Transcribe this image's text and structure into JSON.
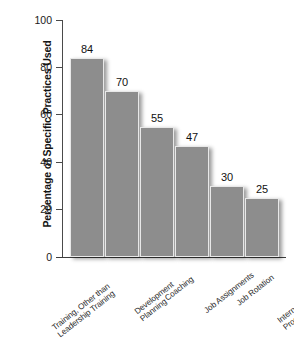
{
  "chart_data": {
    "type": "bar",
    "title": "",
    "subtitle": "",
    "xlabel": "",
    "ylabel": "Percentage of Specific Practices Used",
    "ylim": [
      0,
      100
    ],
    "yticks": [
      0,
      20,
      40,
      60,
      80,
      100
    ],
    "ytick_labels": [
      "0",
      "20",
      "40",
      "60",
      "80",
      "100"
    ],
    "grid": false,
    "legend": null,
    "bar_color": "#8d8d8d",
    "axis_color": "#4a4a4a",
    "background_color": "#ffffff",
    "categories": [
      "Training, Other than\nLeadership Training",
      "Development\nPlanning",
      "Coaching",
      "Job Assignments",
      "Job Rotation",
      "Internal Mentoring\nPrograms"
    ],
    "values": [
      84,
      70,
      55,
      47,
      30,
      25
    ],
    "value_labels": [
      "84",
      "70",
      "55",
      "47",
      "30",
      "25"
    ]
  }
}
